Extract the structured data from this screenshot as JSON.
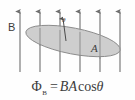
{
  "figure": {
    "background_color": "#fefefe"
  },
  "labels": {
    "field_label": "B",
    "area_label": "A",
    "angle_label": "θ"
  },
  "formula": {
    "symbol": "Φ",
    "subscript": "B",
    "equals": "=",
    "flux_density": "B",
    "area": "A",
    "function": "cos",
    "angle": "θ",
    "full_text": "ΦB = BA cos θ"
  },
  "field_arrows": {
    "count": 6,
    "color": "#6e6e6e",
    "tip_y": 10,
    "tail_y": 72,
    "x_positions": [
      20,
      40,
      60,
      80,
      100,
      120
    ]
  },
  "loop": {
    "shape": "ellipse",
    "fill_color": "#c9c9c9",
    "stroke_color": "#808080",
    "center_x": 73,
    "center_y": 41,
    "radius_x": 48,
    "radius_y": 13,
    "rotation_deg": 11
  },
  "normal_vector": {
    "color": "#4a4a4a",
    "from_x": 66,
    "from_y": 41,
    "to_x": 63,
    "to_y": 17
  }
}
